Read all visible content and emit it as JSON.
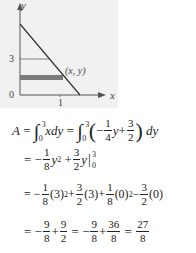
{
  "graph": {
    "axis_x_label": "x",
    "axis_y_label": "y",
    "origin_label": "0",
    "y_tick_label": "3",
    "x_tick_label": "1",
    "point_label": "(x, y)",
    "colors": {
      "background": "#f1f1f1",
      "line": "#333333",
      "strip": "#7a7a7a",
      "axis": "#555555"
    }
  },
  "equations": {
    "line1": {
      "lhs": "A",
      "eq": "=",
      "int1_upper": "3",
      "int1_lower": "0",
      "integrand1": "xdy",
      "eq2": "=",
      "int2_upper": "3",
      "int2_lower": "0",
      "minus": "−",
      "f1_num": "1",
      "f1_den": "4",
      "y": "y",
      "plus": "+",
      "f2_num": "3",
      "f2_den": "2",
      "dy": "dy"
    },
    "line2": {
      "eq": "=",
      "minus": "−",
      "f1_num": "1",
      "f1_den": "8",
      "y2": "y",
      "exp": "2",
      "plus": "+",
      "f2_num": "3",
      "f2_den": "2",
      "y": "y",
      "upper": "3",
      "lower": "0"
    },
    "line3": {
      "eq": "=",
      "minus": "−",
      "f1_num": "1",
      "f1_den": "8",
      "t1": "(3)",
      "exp1": "2",
      "plus1": "+",
      "f2_num": "3",
      "f2_den": "2",
      "t2": "(3)",
      "plus2": "+",
      "f3_num": "1",
      "f3_den": "8",
      "t3": "(0)",
      "exp3": "2",
      "minus2": "−",
      "f4_num": "3",
      "f4_den": "2",
      "t4": "(0)"
    },
    "line4": {
      "eq": "=",
      "minus": "−",
      "f1_num": "9",
      "f1_den": "8",
      "plus": "+",
      "f2_num": "9",
      "f2_den": "2",
      "eq2": "=",
      "minus2": "−",
      "f3_num": "9",
      "f3_den": "8",
      "plus2": "+",
      "f4_num": "36",
      "f4_den": "8",
      "eq3": "=",
      "f5_num": "27",
      "f5_den": "8"
    }
  }
}
